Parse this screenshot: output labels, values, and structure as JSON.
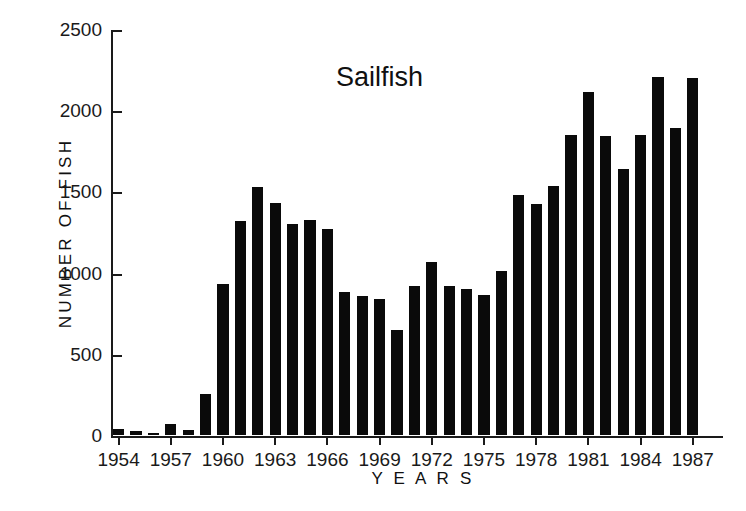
{
  "chart_data": {
    "type": "bar",
    "title": "Sailfish",
    "xlabel": "Y E A R S",
    "ylabel": "NUMBER OF FISH",
    "ylim": [
      0,
      2500
    ],
    "ytick_values": [
      0,
      500,
      1000,
      1500,
      2000,
      2500
    ],
    "ytick_labels": [
      "0",
      "500",
      "1000",
      "1500",
      "2000",
      "2500"
    ],
    "xtick_labels": [
      "1954",
      "1957",
      "1960",
      "1963",
      "1966",
      "1969",
      "1972",
      "1975",
      "1978",
      "1981",
      "1984",
      "1987"
    ],
    "grid": false,
    "legend": false,
    "bar_color": "#0a0a0a",
    "axis_color": "#1a1a1a",
    "categories": [
      "1954",
      "1955",
      "1956",
      "1957",
      "1958",
      "1959",
      "1960",
      "1961",
      "1962",
      "1963",
      "1964",
      "1965",
      "1966",
      "1967",
      "1968",
      "1969",
      "1970",
      "1971",
      "1972",
      "1973",
      "1974",
      "1975",
      "1976",
      "1977",
      "1978",
      "1979",
      "1980",
      "1981",
      "1982",
      "1983",
      "1984",
      "1985",
      "1986",
      "1987"
    ],
    "values": [
      40,
      25,
      10,
      65,
      30,
      250,
      930,
      1320,
      1525,
      1430,
      1300,
      1325,
      1270,
      880,
      855,
      840,
      645,
      915,
      1065,
      915,
      900,
      865,
      1010,
      1475,
      1420,
      1535,
      1845,
      2115,
      1840,
      1640,
      1845,
      2205,
      1890,
      2200
    ]
  }
}
